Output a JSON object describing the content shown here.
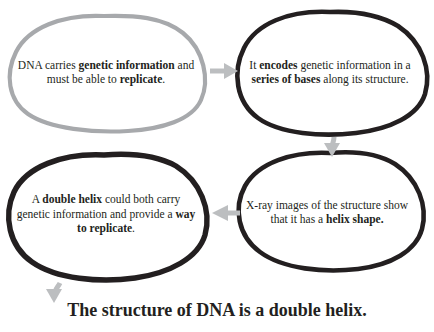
{
  "diagram": {
    "type": "cycle-flow",
    "colors": {
      "outline_gray": "#a7a9ac",
      "outline_black": "#231f20",
      "arrow_gray": "#bcbec0",
      "text": "#231f20",
      "background": "#ffffff"
    },
    "nodes": [
      {
        "id": "node1",
        "outline": "gray",
        "segments": [
          {
            "text": "DNA carries ",
            "bold": false
          },
          {
            "text": "genetic",
            "bold": true
          },
          {
            "text": " ",
            "bold": false
          },
          {
            "text": "information",
            "bold": true
          },
          {
            "text": " and must be able to ",
            "bold": false
          },
          {
            "text": "replicate",
            "bold": true
          },
          {
            "text": ".",
            "bold": false
          }
        ],
        "plain": "DNA carries genetic information and must be able to replicate."
      },
      {
        "id": "node2",
        "outline": "black",
        "segments": [
          {
            "text": "It ",
            "bold": false
          },
          {
            "text": "encodes",
            "bold": true
          },
          {
            "text": " genetic information in a ",
            "bold": false
          },
          {
            "text": "series of bases",
            "bold": true
          },
          {
            "text": " along its structure.",
            "bold": false
          }
        ],
        "plain": "It encodes genetic information in a series of bases along its structure."
      },
      {
        "id": "node3",
        "outline": "black",
        "segments": [
          {
            "text": "X-ray images of the structure show that it has a ",
            "bold": false
          },
          {
            "text": "helix shape.",
            "bold": true
          }
        ],
        "plain": "X-ray images of the structure show that it has a helix shape."
      },
      {
        "id": "node4",
        "outline": "black",
        "segments": [
          {
            "text": "A ",
            "bold": false
          },
          {
            "text": "double helix",
            "bold": true
          },
          {
            "text": " could both carry genetic information and provide a ",
            "bold": false
          },
          {
            "text": "way to replicate",
            "bold": true
          },
          {
            "text": ".",
            "bold": false
          }
        ],
        "plain": "A double helix could both carry genetic information and provide a way to replicate."
      }
    ],
    "arrows": [
      {
        "id": "arrow-1-to-2",
        "from": "node1",
        "to": "node2",
        "direction": "right"
      },
      {
        "id": "arrow-2-to-3",
        "from": "node2",
        "to": "node3",
        "direction": "down"
      },
      {
        "id": "arrow-3-to-4",
        "from": "node3",
        "to": "node4",
        "direction": "left"
      },
      {
        "id": "arrow-4-to-conclusion",
        "from": "node4",
        "to": "headline",
        "direction": "down"
      }
    ],
    "headline": "The structure of DNA is a double helix."
  }
}
